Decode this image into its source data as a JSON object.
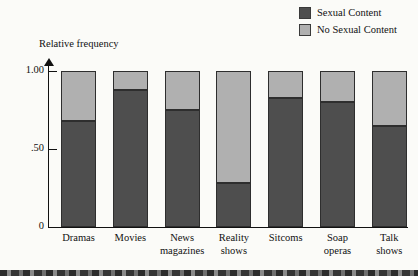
{
  "chart_data": {
    "type": "bar",
    "subtype": "stacked-100-percent",
    "title": "",
    "xlabel": "",
    "ylabel": "Relative frequency",
    "ylim": [
      0,
      1.0
    ],
    "ytick_values": [
      0,
      0.5,
      1.0
    ],
    "ytick_labels": [
      "0",
      ".50",
      "1.00"
    ],
    "grid": false,
    "categories": [
      "Dramas",
      "Movies",
      "News magazines",
      "Reality shows",
      "Sitcoms",
      "Soap operas",
      "Talk shows"
    ],
    "category_lines": [
      [
        "Dramas"
      ],
      [
        "Movies"
      ],
      [
        "News",
        "magazines"
      ],
      [
        "Reality",
        "shows"
      ],
      [
        "Sitcoms"
      ],
      [
        "Soap",
        "operas"
      ],
      [
        "Talk",
        "shows"
      ]
    ],
    "series": [
      {
        "name": "Sexual Content",
        "color": "#4e4e4e",
        "values": [
          0.68,
          0.88,
          0.75,
          0.28,
          0.83,
          0.8,
          0.65
        ]
      },
      {
        "name": "No Sexual Content",
        "color": "#b0b0b0",
        "values": [
          0.32,
          0.12,
          0.25,
          0.72,
          0.17,
          0.2,
          0.35
        ]
      }
    ],
    "legend_position": "top-right"
  },
  "legend": {
    "items": [
      {
        "label": "Sexual Content",
        "color": "#4e4e4e"
      },
      {
        "label": "No Sexual Content",
        "color": "#b0b0b0"
      }
    ]
  },
  "axes": {
    "y_title": "Relative frequency"
  },
  "colors": {
    "sexual_content": "#4e4e4e",
    "no_sexual_content": "#b0b0b0",
    "axis": "#111111",
    "background": "#fbfbf8"
  }
}
